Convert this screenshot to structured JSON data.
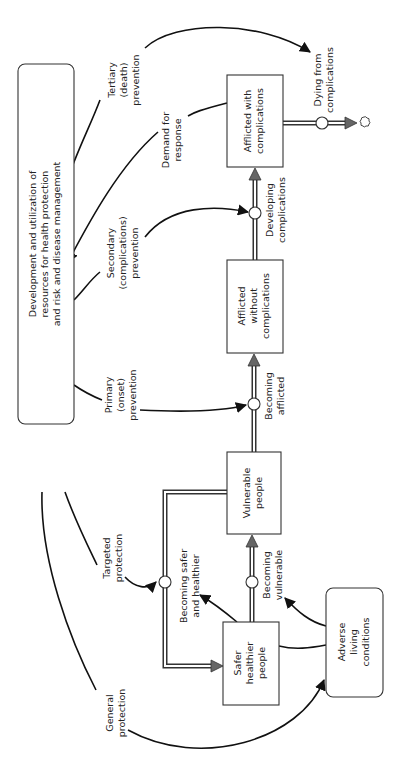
{
  "diagram": {
    "orientation": "rotated-90-ccw",
    "colors": {
      "stroke": "#333333",
      "arrowhead_fill": "#666666",
      "background": "#ffffff"
    },
    "central_box": {
      "lines": [
        "Development and utilization of",
        "resources for health protection",
        "and risk and disease management"
      ]
    },
    "stocks": {
      "safer": {
        "lines": [
          "Safer",
          "healthier",
          "people"
        ]
      },
      "vulnerable": {
        "lines": [
          "Vulnerable",
          "people"
        ]
      },
      "afflicted_without": {
        "lines": [
          "Afflicted",
          "without",
          "complications"
        ]
      },
      "afflicted_with": {
        "lines": [
          "Afflicted with",
          "complications"
        ]
      },
      "adverse": {
        "lines": [
          "Adverse",
          "living",
          "conditions"
        ]
      }
    },
    "flows": {
      "becoming_safer": {
        "lines": [
          "Becoming safer",
          "and healthier"
        ]
      },
      "becoming_vulnerable": {
        "lines": [
          "Becoming",
          "vulnerable"
        ]
      },
      "becoming_afflicted": {
        "lines": [
          "Becoming",
          "afflicted"
        ]
      },
      "developing_complications": {
        "lines": [
          "Developing",
          "complications"
        ]
      },
      "dying": {
        "lines": [
          "Dying from",
          "complications"
        ]
      }
    },
    "links": {
      "general_protection": {
        "lines": [
          "General",
          "protection"
        ]
      },
      "targeted_protection": {
        "lines": [
          "Targeted",
          "protection"
        ]
      },
      "primary_prevention": {
        "lines": [
          "Primary",
          "(onset)",
          "prevention"
        ]
      },
      "secondary_prevention": {
        "lines": [
          "Secondary",
          "(complications)",
          "prevention"
        ]
      },
      "tertiary_prevention": {
        "lines": [
          "Tertiary",
          "(death)",
          "prevention"
        ]
      },
      "demand_for_response": {
        "lines": [
          "Demand for",
          "response"
        ]
      }
    },
    "icons": {
      "sink": "cloud-icon",
      "valve": "valve-circle-icon",
      "flow_arrow": "triangle-arrowhead-icon"
    }
  }
}
